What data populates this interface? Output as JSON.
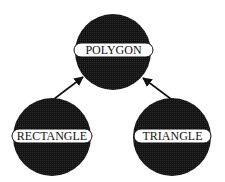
{
  "diagram": {
    "type": "class-hierarchy",
    "colors": {
      "node_fill": "#141414",
      "label_fill": "#ffffff",
      "label_stroke": "#111111",
      "edge": "#111111",
      "text": "#111111"
    },
    "nodes": [
      {
        "id": "polygon",
        "label": "POLYGON",
        "cx": 113,
        "cy": 52,
        "r": 38,
        "pill": {
          "x": 74,
          "y": 43,
          "w": 79,
          "h": 14
        }
      },
      {
        "id": "rectangle",
        "label": "RECTANGLE",
        "cx": 52,
        "cy": 137,
        "r": 39,
        "pill": {
          "x": 12,
          "y": 129,
          "w": 80,
          "h": 14
        }
      },
      {
        "id": "triangle",
        "label": "TRIANGLE",
        "cx": 172,
        "cy": 137,
        "r": 39,
        "pill": {
          "x": 134,
          "y": 129,
          "w": 77,
          "h": 14
        }
      }
    ],
    "edges": [
      {
        "from": "rectangle",
        "to": "polygon",
        "x1": 54,
        "y1": 99,
        "x2": 83,
        "y2": 77
      },
      {
        "from": "triangle",
        "to": "polygon",
        "x1": 171,
        "y1": 99,
        "x2": 143,
        "y2": 78
      }
    ]
  }
}
